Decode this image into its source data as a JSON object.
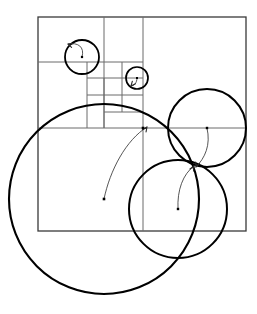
{
  "figure": {
    "canvas": {
      "width": 257,
      "height": 314,
      "background": "#ffffff"
    },
    "style": {
      "grid_stroke": "#3a3a3a",
      "grid_stroke_light": "#6b6b6b",
      "circle_stroke": "#000000",
      "arrow_stroke": "#2b2b2b",
      "dot_fill": "#000000",
      "outer_rect_width": 1.3,
      "grid_line_width": 1.0,
      "circle_line_width": 2.0,
      "arrow_line_width": 0.8
    },
    "outer_rectangle": {
      "x": 38,
      "y": 17,
      "width": 208,
      "height": 214
    },
    "grid_lines": [
      {
        "name": "vertical-major-right",
        "x1": 143,
        "y1": 17,
        "x2": 143,
        "y2": 231
      },
      {
        "name": "horizontal-major-mid",
        "x1": 38,
        "y1": 128,
        "x2": 246,
        "y2": 128
      },
      {
        "name": "vertical-sub-1",
        "x1": 104,
        "y1": 17,
        "x2": 104,
        "y2": 128
      },
      {
        "name": "horizontal-sub-1",
        "x1": 38,
        "y1": 62,
        "x2": 143,
        "y2": 62
      },
      {
        "name": "vertical-sub-2",
        "x1": 87,
        "y1": 62,
        "x2": 87,
        "y2": 128
      },
      {
        "name": "horizontal-sub-2",
        "x1": 87,
        "y1": 78,
        "x2": 143,
        "y2": 78
      },
      {
        "name": "vertical-sub-3",
        "x1": 122,
        "y1": 62,
        "x2": 122,
        "y2": 112
      },
      {
        "name": "horizontal-sub-3",
        "x1": 87,
        "y1": 95,
        "x2": 143,
        "y2": 95
      },
      {
        "name": "vertical-sub-4",
        "x1": 104,
        "y1": 78,
        "x2": 104,
        "y2": 128
      },
      {
        "name": "horizontal-sub-4",
        "x1": 104,
        "y1": 112,
        "x2": 143,
        "y2": 112
      }
    ],
    "circles": [
      {
        "id": "large-circle",
        "label": "large-bottom-left-circle",
        "cx": 104,
        "cy": 199,
        "r": 95,
        "stroke_width": 2.1,
        "arrow": {
          "from": {
            "x": 104,
            "y": 199
          },
          "to": {
            "x": 147,
            "y": 127
          },
          "control1": {
            "x": 110,
            "y": 170
          },
          "control2": {
            "x": 126,
            "y": 140
          },
          "head_angle_deg": -55
        }
      },
      {
        "id": "upper-right-circle",
        "label": "upper-right-circle",
        "cx": 207,
        "cy": 128,
        "r": 39,
        "stroke_width": 2.0,
        "arrow": {
          "from": {
            "x": 207,
            "y": 128
          },
          "to": {
            "x": 196,
            "y": 167
          },
          "control1": {
            "x": 211,
            "y": 145
          },
          "control2": {
            "x": 205,
            "y": 158
          },
          "head_angle_deg": 110
        }
      },
      {
        "id": "lower-right-circle",
        "label": "lower-right-circle",
        "cx": 178,
        "cy": 209,
        "r": 49,
        "stroke_width": 2.0,
        "arrow": {
          "from": {
            "x": 178,
            "y": 209
          },
          "to": {
            "x": 194,
            "y": 166
          },
          "control1": {
            "x": 177,
            "y": 190
          },
          "control2": {
            "x": 183,
            "y": 174
          },
          "head_angle_deg": -60
        }
      },
      {
        "id": "small-circle-top-left",
        "label": "small-circle-top-left",
        "cx": 82,
        "cy": 57,
        "r": 17,
        "stroke_width": 1.8,
        "arrow": {
          "from": {
            "x": 82,
            "y": 57
          },
          "to": {
            "x": 68,
            "y": 44
          },
          "control1": {
            "x": 85,
            "y": 47
          },
          "control2": {
            "x": 78,
            "y": 42
          },
          "head_angle_deg": 200
        }
      },
      {
        "id": "tiny-circle-mid",
        "label": "tiny-circle-mid",
        "cx": 137,
        "cy": 78,
        "r": 11,
        "stroke_width": 1.7,
        "arrow": {
          "from": {
            "x": 137,
            "y": 78
          },
          "to": {
            "x": 131,
            "y": 86
          },
          "control1": {
            "x": 137,
            "y": 83
          },
          "control2": {
            "x": 134,
            "y": 86
          },
          "head_angle_deg": 130
        }
      }
    ],
    "center_dots": [
      {
        "name": "dot-large-circle",
        "x": 104,
        "y": 199,
        "size": 2.6
      },
      {
        "name": "dot-upper-right-circle",
        "x": 207,
        "y": 128,
        "size": 2.4
      },
      {
        "name": "dot-lower-right-circle",
        "x": 178,
        "y": 209,
        "size": 2.4
      },
      {
        "name": "dot-small-circle",
        "x": 82,
        "y": 57,
        "size": 2.2
      },
      {
        "name": "dot-tiny-circle",
        "x": 137,
        "y": 78,
        "size": 2.0
      },
      {
        "name": "dot-grid-intersection",
        "x": 143,
        "y": 128,
        "size": 2.6
      }
    ]
  }
}
